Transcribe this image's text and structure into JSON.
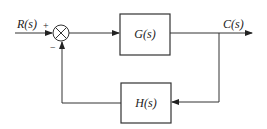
{
  "diagram": {
    "type": "feedback control block diagram",
    "input_label": "R(s)",
    "output_label": "C(s)",
    "summing_junction": {
      "plus_sign": "+",
      "minus_sign": "−"
    },
    "forward_block": {
      "label": "G(s)"
    },
    "feedback_block": {
      "label": "H(s)"
    }
  }
}
